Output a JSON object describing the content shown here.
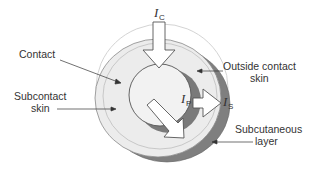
{
  "diagram": {
    "labels": {
      "contact": "Contact",
      "subcontact_line1": "Subcontact",
      "subcontact_line2": "skin",
      "outside_line1": "Outside contact",
      "outside_line2": "skin",
      "subcut_line1": "Subcutaneous",
      "subcut_line2": "layer"
    },
    "currents": {
      "contact": {
        "symbol": "I",
        "subscript": "C"
      },
      "penetrating": {
        "symbol": "I",
        "subscript": "P"
      },
      "surface": {
        "symbol": "I",
        "subscript": "S"
      }
    },
    "colors": {
      "disc_fill": "#ececec",
      "inner_fill": "#f2f2f2",
      "shadow": "#7a7a7a",
      "outline": "#555555",
      "arrow_fill": "#ffffff"
    }
  }
}
